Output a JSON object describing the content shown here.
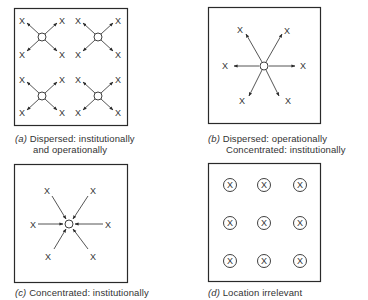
{
  "figure": {
    "panels": [
      {
        "id": "a",
        "tag": "(a)",
        "caption_line1": "Dispersed:  institutionally",
        "caption_line2": "and operationally",
        "description": "Four circles, each with arrows pointing outward to four X marks at the diagonals",
        "hubs": 4,
        "arrow_direction": "outward"
      },
      {
        "id": "b",
        "tag": "(b)",
        "caption_line1": "Dispersed:  operationally",
        "caption_line2": "Concentrated:  institutionally",
        "description": "One central circle with six arrows pointing outward to six X marks",
        "hubs": 1,
        "arrow_direction": "outward"
      },
      {
        "id": "c",
        "tag": "(c)",
        "caption_line1": "Concentrated:  institutionally",
        "caption_line2": "",
        "description": "Six X marks with arrows pointing inward to one central circle",
        "hubs": 1,
        "arrow_direction": "inward"
      },
      {
        "id": "d",
        "tag": "(d)",
        "caption_line1": "Location irrelevant",
        "caption_line2": "",
        "description": "3x3 grid of circled X marks",
        "grid": [
          3,
          3
        ]
      }
    ],
    "marker_label": "X",
    "colors": {
      "stroke": "#2a2a2a",
      "background": "#ffffff"
    }
  }
}
